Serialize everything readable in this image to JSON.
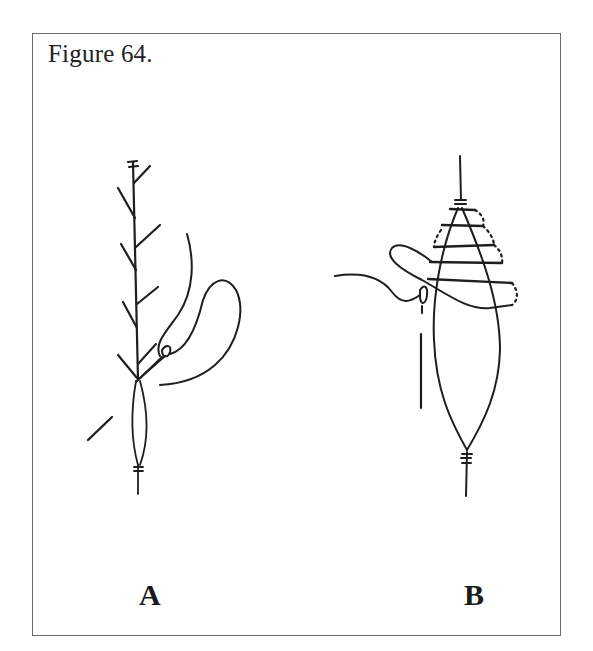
{
  "figure": {
    "caption": "Figure 64.",
    "border_color": "#6a6a6a",
    "ink_color": "#1e1e1e",
    "panels": [
      {
        "label": "A",
        "description": "Vertical stem with alternating side branches; a looped cord passes through a small ring/eyelet near the lower stem, with an elongated lens-shaped loop below and a diagonal short line to the lower left."
      },
      {
        "label": "B",
        "description": "Vertical cord with tall elongated lens-shaped outline; horizontal wraps (dotted on the right) bind the tapered top; a looped cord passes through an eyelet on the left side; a short vertical bar hangs below the eyelet."
      }
    ]
  }
}
